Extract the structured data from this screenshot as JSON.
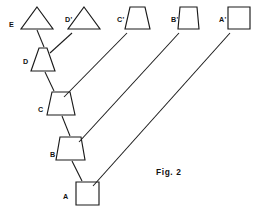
{
  "figure": {
    "caption": "Fig. 2",
    "caption_x": 156,
    "caption_y": 175,
    "stroke_color": "#1a1a1a",
    "background_color": "#ffffff",
    "width": 259,
    "height": 214
  },
  "staircase_shapes": [
    {
      "id": "shape-e",
      "label": "E",
      "kind": "triangle",
      "label_x": 9,
      "label_y": 27,
      "points": "37,7 53,29 21,29",
      "cx": 37,
      "cy": 29
    },
    {
      "id": "shape-d",
      "label": "D",
      "kind": "trapezoid",
      "label_x": 23,
      "label_y": 64,
      "points": "39,48 47,48 55,71 31,71",
      "cx": 43,
      "cy": 71
    },
    {
      "id": "shape-c",
      "label": "C",
      "kind": "trapezoid",
      "label_x": 38,
      "label_y": 112,
      "points": "52,92 70,92 75,115 47,115",
      "cx": 61,
      "cy": 115
    },
    {
      "id": "shape-b",
      "label": "B",
      "kind": "trapezoid",
      "label_x": 50,
      "label_y": 157,
      "points": "60,137 81,137 85,160 56,160",
      "cx": 70,
      "cy": 160
    },
    {
      "id": "shape-a",
      "label": "A",
      "kind": "square",
      "label_x": 63,
      "label_y": 199,
      "points": "76,182 99,182 99,205 76,205",
      "cx": 87,
      "cy": 182
    }
  ],
  "primed_shapes": [
    {
      "id": "shape-d-prime",
      "label": "D'",
      "kind": "triangle",
      "label_x": 65,
      "label_y": 22,
      "points": "84,7 100,29 68,29"
    },
    {
      "id": "shape-c-prime",
      "label": "C'",
      "kind": "trapezoid",
      "label_x": 117,
      "label_y": 22,
      "points": "130,7 145,7 150,29 125,29"
    },
    {
      "id": "shape-b-prime",
      "label": "B'",
      "kind": "trapezoid",
      "label_x": 171,
      "label_y": 22,
      "points": "180,7 197,7 199,29 178,29"
    },
    {
      "id": "shape-a-prime",
      "label": "A'",
      "kind": "square",
      "label_x": 219,
      "label_y": 22,
      "points": "228,7 250,7 250,29 228,29"
    }
  ],
  "chain_connectors": [
    {
      "id": "connector-e-d",
      "from": "E",
      "to": "D",
      "x1": 37,
      "y1": 30,
      "x2": 44,
      "y2": 47
    },
    {
      "id": "connector-d-c",
      "from": "D",
      "to": "C",
      "x1": 45,
      "y1": 72,
      "x2": 54,
      "y2": 91
    },
    {
      "id": "connector-c-b",
      "from": "C",
      "to": "B",
      "x1": 62,
      "y1": 116,
      "x2": 70,
      "y2": 136
    },
    {
      "id": "connector-b-a",
      "from": "B",
      "to": "A",
      "x1": 72,
      "y1": 161,
      "x2": 82,
      "y2": 181
    }
  ],
  "diagonal_connectors": [
    {
      "id": "connector-dprime-d",
      "from": "D'",
      "to": "D",
      "x1": 72,
      "y1": 33,
      "x2": 50,
      "y2": 53
    },
    {
      "id": "connector-cprime-c",
      "from": "C'",
      "to": "C",
      "x1": 127,
      "y1": 33,
      "x2": 64,
      "y2": 97
    },
    {
      "id": "connector-bprime-b",
      "from": "B'",
      "to": "B",
      "x1": 179,
      "y1": 33,
      "x2": 79,
      "y2": 142
    },
    {
      "id": "connector-aprime-a",
      "from": "A'",
      "to": "A",
      "x1": 230,
      "y1": 33,
      "x2": 93,
      "y2": 186
    }
  ]
}
